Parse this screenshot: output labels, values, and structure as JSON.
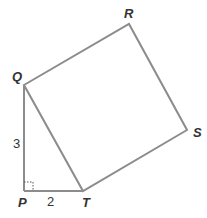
{
  "diagram": {
    "type": "geometry",
    "stroke_color": "#8c8c8c",
    "label_color": "#333333",
    "vertices": {
      "P": {
        "label": "P",
        "x": 24,
        "y": 191
      },
      "Q": {
        "label": "Q",
        "x": 24,
        "y": 85
      },
      "R": {
        "label": "R",
        "x": 129,
        "y": 24
      },
      "S": {
        "label": "S",
        "x": 187,
        "y": 130
      },
      "T": {
        "label": "T",
        "x": 83,
        "y": 191
      }
    },
    "side_labels": {
      "PQ": "3",
      "PT": "2"
    },
    "right_angle_at": "P"
  }
}
